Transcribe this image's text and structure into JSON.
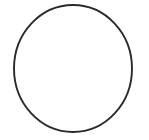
{
  "canvas": {
    "width": 149,
    "height": 140,
    "background_color": "#ffffff",
    "description": "Single unfilled circle outline centered on a plain white field"
  },
  "shapes": [
    {
      "name": "circle-outline",
      "type": "ellipse",
      "center_x": 73,
      "center_y": 68.5,
      "radius_x": 59,
      "radius_y": 63.5,
      "stroke_color": "#2a2a2a",
      "stroke_width": 1.9,
      "fill": "none",
      "bounds": {
        "left": 14,
        "top": 5,
        "right": 132,
        "bottom": 132
      }
    }
  ],
  "text": []
}
